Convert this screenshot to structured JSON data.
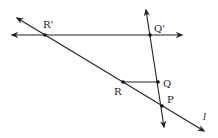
{
  "diagram": {
    "type": "geometry-construction",
    "colors": {
      "line": "#222222",
      "background": "#ffffff"
    },
    "points": [
      {
        "id": "R_prime",
        "label": "R'",
        "x": 45,
        "y": 35
      },
      {
        "id": "Q_prime",
        "label": "Q'",
        "x": 150,
        "y": 35
      },
      {
        "id": "R",
        "label": "R",
        "x": 123,
        "y": 82
      },
      {
        "id": "Q",
        "label": "Q",
        "x": 158,
        "y": 82
      },
      {
        "id": "P",
        "label": "P",
        "x": 162,
        "y": 106
      }
    ],
    "lines": [
      {
        "id": "line_l",
        "label": "l",
        "through": [
          "R'",
          "R",
          "P"
        ],
        "double_arrow": true
      },
      {
        "id": "line_horizontal",
        "through": [
          "R'",
          "Q'"
        ],
        "double_arrow": true
      },
      {
        "id": "line_vertical",
        "through": [
          "Q'",
          "Q",
          "P"
        ],
        "double_arrow": true
      }
    ],
    "segments": [
      {
        "id": "seg_RQ",
        "from": "R",
        "to": "Q"
      }
    ],
    "labels": {
      "r_prime": "R'",
      "q_prime": "Q'",
      "r": "R",
      "q": "Q",
      "p": "P",
      "l": "l"
    }
  }
}
